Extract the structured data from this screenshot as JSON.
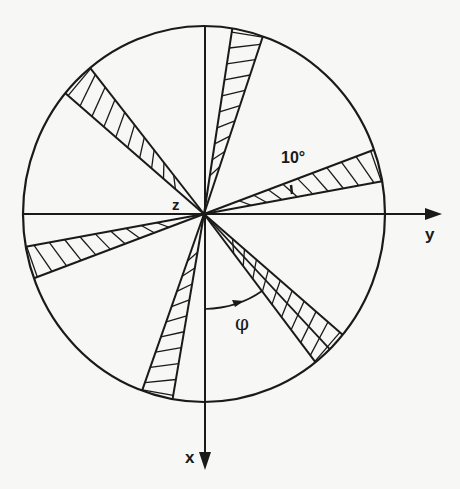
{
  "diagram": {
    "type": "polar sector diagram",
    "center": {
      "x": 204,
      "y": 214
    },
    "radius_x": 181,
    "radius_y": 188,
    "axes": {
      "y": {
        "label": "y",
        "direction": "right"
      },
      "x": {
        "label": "x",
        "direction": "down"
      },
      "z": {
        "label": "z",
        "direction": "out of page (at center)"
      }
    },
    "angle_label": "10°",
    "phi_label": "φ",
    "wedges": [
      {
        "name": "wedge-upper-right",
        "from_deg_cw_from_up": 9,
        "to_deg_cw_from_up": 19,
        "hatch": "diagonal"
      },
      {
        "name": "wedge-right",
        "from_deg_cw_from_up": 70,
        "to_deg_cw_from_up": 80,
        "hatch": "diagonal"
      },
      {
        "name": "wedge-lower-right",
        "from_deg_cw_from_up": 130,
        "to_deg_cw_from_up": 142,
        "hatch": "cross",
        "center_line_deg": 136
      },
      {
        "name": "wedge-lower-left",
        "from_deg_cw_from_up": 190,
        "to_deg_cw_from_up": 200,
        "hatch": "diagonal"
      },
      {
        "name": "wedge-left",
        "from_deg_cw_from_up": 250,
        "to_deg_cw_from_up": 260,
        "hatch": "diagonal"
      },
      {
        "name": "wedge-upper-left",
        "from_deg_cw_from_up": 310,
        "to_deg_cw_from_up": 321,
        "hatch": "vertical"
      }
    ]
  }
}
